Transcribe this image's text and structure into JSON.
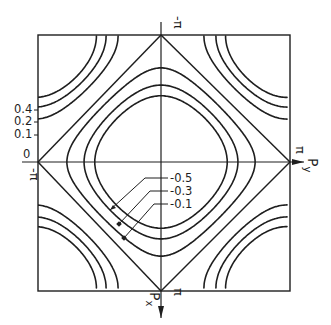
{
  "figure": {
    "axes": {
      "horizontal": {
        "label": "P",
        "subscript": "y",
        "max_label": "π",
        "min_label": "-π"
      },
      "vertical": {
        "label": "P",
        "subscript": "x",
        "max_label": "π",
        "min_label": "-π"
      }
    },
    "outer_contour_labels": [
      "0.4",
      "0.2",
      "0.1",
      "0"
    ],
    "inner_contour_labels": [
      "-0.5",
      "-0.3",
      "-0.1"
    ],
    "stroke_color": "#1e1e1e",
    "background_color": "#ffffff"
  },
  "render": {
    "center": [
      161,
      162
    ],
    "half_size": 126,
    "inner_levels": [
      -0.46,
      -0.33,
      -0.15
    ],
    "corner_levels": [
      0.52,
      0.4,
      0.26
    ]
  }
}
